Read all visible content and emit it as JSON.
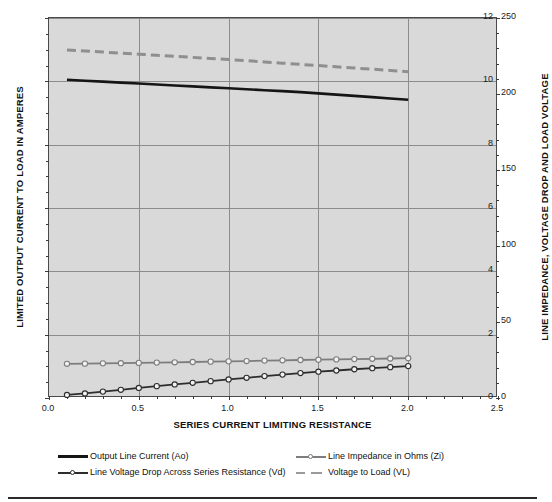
{
  "chart_data": {
    "type": "line",
    "title": "",
    "xlabel": "SERIES CURRENT LIMITING  RESISTANCE",
    "ylabel": "LIMITED OUTPUT CURRENT TO LOAD IN AMPERES",
    "y2label": "LINE IMPEDANCE, VOLTAGE DROP AND LOAD VOLTAGE",
    "xlim": [
      0.0,
      2.5
    ],
    "ylim": [
      0,
      12
    ],
    "y2lim": [
      0,
      250
    ],
    "grid": true,
    "legend_position": "below-plot",
    "x_ticks": [
      "0.0",
      "0.5",
      "1.0",
      "1.5",
      "2.0",
      "2.5"
    ],
    "x_tick_values": [
      0.0,
      0.5,
      1.0,
      1.5,
      2.0,
      2.5
    ],
    "y_ticks": [
      "0",
      "2",
      "4",
      "6",
      "8",
      "10",
      "12"
    ],
    "y_tick_values": [
      0,
      2,
      4,
      6,
      8,
      10,
      12
    ],
    "y2_ticks": [
      "0",
      "50",
      "100",
      "150",
      "200",
      "250"
    ],
    "y2_tick_values": [
      0,
      50,
      100,
      150,
      200,
      250
    ],
    "x": [
      0.1,
      0.2,
      0.3,
      0.4,
      0.5,
      0.6,
      0.7,
      0.8,
      0.9,
      1.0,
      1.1,
      1.2,
      1.3,
      1.4,
      1.5,
      1.6,
      1.7,
      1.8,
      1.9,
      2.0
    ],
    "series": [
      {
        "name": "Output Line Current (Ao)",
        "axis": "left",
        "style": "solid",
        "color": "#151515",
        "marker": "none",
        "values": [
          10.05,
          10.02,
          9.99,
          9.96,
          9.93,
          9.9,
          9.87,
          9.84,
          9.81,
          9.78,
          9.75,
          9.72,
          9.69,
          9.66,
          9.62,
          9.58,
          9.54,
          9.5,
          9.46,
          9.42
        ]
      },
      {
        "name": "Line Voltage Drop Across Series Resistance (Vd)",
        "axis": "right",
        "style": "solid-marker",
        "color": "#2d2d2d",
        "marker": "circle",
        "values": [
          2.0,
          3.0,
          4.2,
          5.4,
          6.6,
          7.8,
          8.9,
          10.0,
          11.1,
          12.2,
          13.3,
          14.4,
          15.4,
          16.4,
          17.3,
          18.1,
          18.9,
          19.6,
          20.3,
          21.0
        ]
      },
      {
        "name": "Line Impedance in Ohms (Zi)",
        "axis": "right",
        "style": "solid-marker",
        "color": "#7d7d7d",
        "marker": "circle",
        "values": [
          22.5,
          22.6,
          22.8,
          22.9,
          23.1,
          23.3,
          23.5,
          23.7,
          23.9,
          24.1,
          24.3,
          24.6,
          24.8,
          25.0,
          25.2,
          25.4,
          25.6,
          25.8,
          26.0,
          26.2
        ]
      },
      {
        "name": "Voltage to Load (VL)",
        "axis": "right",
        "style": "dashed",
        "color": "#8f8f8f",
        "marker": "none",
        "values": [
          229.0,
          228.3,
          227.6,
          226.9,
          226.2,
          225.5,
          224.8,
          224.1,
          223.4,
          222.7,
          221.9,
          221.1,
          220.3,
          219.5,
          218.7,
          217.9,
          217.1,
          216.3,
          215.5,
          214.7
        ]
      }
    ]
  },
  "legend": {
    "items": [
      {
        "label": "Output Line Current (Ao)"
      },
      {
        "label": "Line Impedance in Ohms (Zi)"
      },
      {
        "label": "Line Voltage Drop Across Series Resistance (Vd)"
      },
      {
        "label": "Voltage to Load (VL)"
      }
    ]
  },
  "colors": {
    "plot_background": "#d9d9d9",
    "grid": "#8c8c8c",
    "axis": "#4a4a4a",
    "series_ao": "#151515",
    "series_vd": "#2d2d2d",
    "series_zi": "#7d7d7d",
    "series_vl": "#8f8f8f"
  }
}
